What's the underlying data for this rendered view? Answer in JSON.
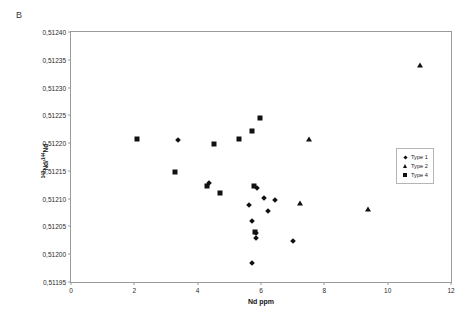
{
  "panel": {
    "label": "B"
  },
  "chart_data": {
    "type": "scatter",
    "title": "",
    "xlabel": "Nd ppm",
    "ylabel": "143Nd/144Nd",
    "ylabel_numerator": "143",
    "ylabel_denominator": "144",
    "ylabel_base": "Nd/",
    "ylabel_base2": "Nd",
    "xlim": [
      0,
      12
    ],
    "ylim": [
      0.51195,
      0.5124
    ],
    "xticks": [
      "0",
      "2",
      "4",
      "6",
      "8",
      "10",
      "12"
    ],
    "xtick_values": [
      0,
      2,
      4,
      6,
      8,
      10,
      12
    ],
    "yticks": [
      "0,51195",
      "0,51200",
      "0,51205",
      "0,51210",
      "0,51215",
      "0,51220",
      "0,51225",
      "0,51230",
      "0,51235",
      "0,51240"
    ],
    "ytick_values": [
      0.51195,
      0.512,
      0.51205,
      0.5121,
      0.51215,
      0.5122,
      0.51225,
      0.5123,
      0.51235,
      0.5124
    ],
    "grid": false,
    "legend_position": "right-middle",
    "marker_color": "#111111",
    "frame_color": "#9a9a9a",
    "series": [
      {
        "name": "Type 1",
        "marker": "diamond",
        "points": [
          {
            "x": 3.38,
            "y": 0.512205
          },
          {
            "x": 4.35,
            "y": 0.512128
          },
          {
            "x": 5.88,
            "y": 0.51212
          },
          {
            "x": 6.1,
            "y": 0.512102
          },
          {
            "x": 6.45,
            "y": 0.512097
          },
          {
            "x": 5.62,
            "y": 0.512088
          },
          {
            "x": 6.22,
            "y": 0.512078
          },
          {
            "x": 5.72,
            "y": 0.51206
          },
          {
            "x": 5.83,
            "y": 0.512038
          },
          {
            "x": 5.83,
            "y": 0.51203
          },
          {
            "x": 7.0,
            "y": 0.512023
          },
          {
            "x": 5.72,
            "y": 0.511985
          }
        ]
      },
      {
        "name": "Type 2",
        "marker": "triangle",
        "points": [
          {
            "x": 11.02,
            "y": 0.51234
          },
          {
            "x": 7.52,
            "y": 0.512207
          },
          {
            "x": 7.22,
            "y": 0.512092
          },
          {
            "x": 9.38,
            "y": 0.512082
          }
        ]
      },
      {
        "name": "Type 4",
        "marker": "square",
        "points": [
          {
            "x": 2.08,
            "y": 0.512207
          },
          {
            "x": 4.53,
            "y": 0.512199
          },
          {
            "x": 5.98,
            "y": 0.512245
          },
          {
            "x": 5.72,
            "y": 0.512222
          },
          {
            "x": 5.3,
            "y": 0.512207
          },
          {
            "x": 3.28,
            "y": 0.512148
          },
          {
            "x": 4.28,
            "y": 0.512122
          },
          {
            "x": 4.72,
            "y": 0.51211
          },
          {
            "x": 5.78,
            "y": 0.512122
          },
          {
            "x": 5.8,
            "y": 0.51204
          }
        ]
      }
    ]
  }
}
